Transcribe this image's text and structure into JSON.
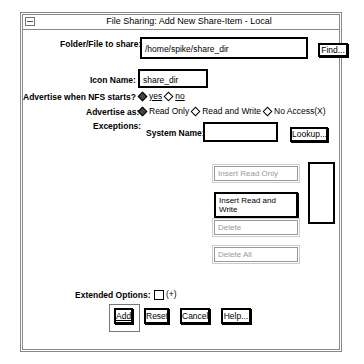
{
  "window": {
    "title": "File Sharing: Add New Share-Item - Local"
  },
  "form": {
    "folder_label": "Folder/File to share:",
    "folder_value": "/home/spike/share_dir",
    "find_button": "Find...",
    "icon_label": "Icon Name:",
    "icon_value": "share_dir",
    "nfs_label": "Advertise when NFS starts?",
    "nfs_options": [
      {
        "label": "yes",
        "selected": true
      },
      {
        "label": "no",
        "selected": false
      }
    ],
    "advertise_label": "Advertise as:",
    "advertise_options": [
      {
        "label": "Read Only",
        "selected": true
      },
      {
        "label": "Read and Write",
        "selected": false
      },
      {
        "label": "No Access(X)",
        "selected": false
      }
    ],
    "exceptions_label": "Exceptions:",
    "system_name_label": "System Name:",
    "system_name_value": "",
    "lookup_button": "Lookup...",
    "insert_read_only": "Insert Read Only",
    "insert_read_write": "Insert Read and Write",
    "delete": "Delete",
    "delete_all": "Delete All",
    "extended_label": "Extended Options:",
    "extended_toggle": "(+)"
  },
  "footer": {
    "add": "Add",
    "reset": "Reset",
    "cancel": "Cancel",
    "help": "Help..."
  }
}
